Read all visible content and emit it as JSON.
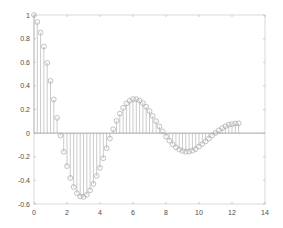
{
  "chart_data": {
    "type": "stem",
    "title": "",
    "xlabel": "",
    "ylabel": "",
    "xlim": [
      0,
      14
    ],
    "ylim": [
      -0.6,
      1
    ],
    "xticks": [
      0,
      2,
      4,
      6,
      8,
      10,
      12,
      14
    ],
    "yticks": [
      -0.6,
      -0.4,
      -0.2,
      0,
      0.2,
      0.4,
      0.6,
      0.8,
      1
    ],
    "grid": false,
    "legend": null,
    "series": [
      {
        "name": "y = cos(t)·exp(-0.2t)",
        "marker": "circle-open",
        "color": "#a6a6a6",
        "x_start": 0,
        "x_step": 0.2,
        "x_end": 12.4,
        "x": [
          0,
          0.2,
          0.4,
          0.6,
          0.8,
          1,
          1.2,
          1.4,
          1.6,
          1.8,
          2,
          2.2,
          2.4,
          2.6,
          2.8,
          3,
          3.2,
          3.4,
          3.6,
          3.8,
          4,
          4.2,
          4.4,
          4.6,
          4.8,
          5,
          5.2,
          5.4,
          5.6,
          5.8,
          6,
          6.2,
          6.4,
          6.6,
          6.8,
          7,
          7.2,
          7.4,
          7.6,
          7.8,
          8,
          8.2,
          8.4,
          8.6,
          8.8,
          9,
          9.2,
          9.4,
          9.6,
          9.8,
          10,
          10.2,
          10.4,
          10.6,
          10.8,
          11,
          11.2,
          11.4,
          11.6,
          11.8,
          12,
          12.2,
          12.4
        ],
        "values": [
          1.0,
          0.941,
          0.851,
          0.733,
          0.594,
          0.442,
          0.285,
          0.129,
          -0.021,
          -0.158,
          -0.279,
          -0.379,
          -0.456,
          -0.508,
          -0.536,
          -0.54,
          -0.522,
          -0.484,
          -0.43,
          -0.362,
          -0.294,
          -0.213,
          -0.128,
          -0.045,
          0.033,
          0.104,
          0.165,
          0.214,
          0.251,
          0.274,
          0.288,
          0.288,
          0.276,
          0.254,
          0.223,
          0.186,
          0.145,
          0.101,
          0.057,
          0.015,
          -0.029,
          -0.064,
          -0.095,
          -0.12,
          -0.139,
          -0.151,
          -0.157,
          -0.155,
          -0.148,
          -0.136,
          -0.113,
          -0.093,
          -0.07,
          -0.046,
          -0.021,
          0.0017,
          0.023,
          0.042,
          0.058,
          0.071,
          0.076,
          0.081,
          0.083
        ]
      }
    ]
  },
  "axes": {
    "color": "#d9d9d9",
    "zero_line_color": "#a6a6a6",
    "tick_label_color": "#4d4d4d"
  }
}
